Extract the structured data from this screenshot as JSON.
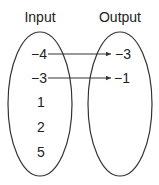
{
  "diagram": {
    "type": "mapping-diagram",
    "input_set": {
      "title": "Input",
      "values": [
        "−4",
        "−3",
        "1",
        "2",
        "5"
      ]
    },
    "output_set": {
      "title": "Output",
      "values": [
        "−3",
        "−1"
      ]
    },
    "mappings": [
      {
        "from": "−4",
        "to": "−3"
      },
      {
        "from": "−3",
        "to": "−1"
      }
    ],
    "colors": {
      "stroke": "#333333",
      "text": "#222222",
      "background": "#ffffff"
    }
  }
}
